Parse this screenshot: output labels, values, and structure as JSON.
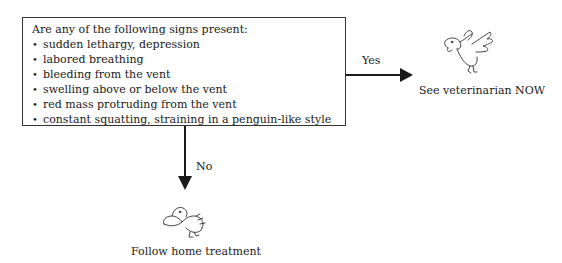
{
  "question_box": {
    "question": "Are any of the following signs present:",
    "bullet_glyph": "•",
    "signs": [
      "sudden lethargy, depression",
      "labored breathing",
      "bleeding from the vent",
      "swelling above or below the vent",
      "red mass protruding from the vent",
      "constant squatting, straining in a penguin-like style"
    ]
  },
  "yes_branch": {
    "label": "Yes",
    "icon": "distressed-bird-icon",
    "outcome": "See veterinarian NOW"
  },
  "no_branch": {
    "label": "No",
    "icon": "resting-bird-icon",
    "outcome": "Follow home treatment"
  },
  "colors": {
    "line": "#1a1a1a",
    "background": "#ffffff"
  }
}
